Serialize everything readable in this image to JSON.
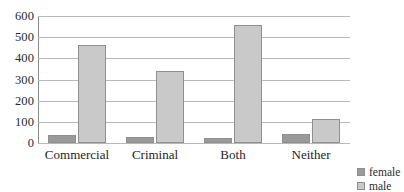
{
  "chart_data": {
    "type": "bar",
    "title": "",
    "subtitle": "",
    "xlabel": "",
    "ylabel": "",
    "categories": [
      "Commercial",
      "Criminal",
      "Both",
      "Neither"
    ],
    "series": [
      {
        "name": "female",
        "color": "#9a9a9a",
        "values": [
          38,
          28,
          22,
          42
        ]
      },
      {
        "name": "male",
        "color": "#c9c9c9",
        "values": [
          465,
          338,
          557,
          115
        ]
      }
    ],
    "ylim": [
      0,
      600
    ],
    "ytick_labels": [
      "0",
      "100",
      "200",
      "300",
      "400",
      "500",
      "600"
    ],
    "ytick_values": [
      0,
      100,
      200,
      300,
      400,
      500,
      600
    ],
    "grid": true,
    "grid_axis": "y",
    "legend": {
      "position": "bottom-right",
      "entries": [
        {
          "label": "female",
          "color": "#9a9a9a"
        },
        {
          "label": "male",
          "color": "#c9c9c9"
        }
      ]
    },
    "axis_color": "#8a8a8a",
    "gridline_color": "#b8b8b8",
    "background": "#ffffff"
  }
}
